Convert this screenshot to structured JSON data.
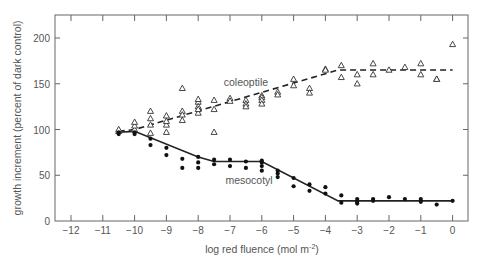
{
  "chart_data": {
    "type": "scatter",
    "title": "",
    "xlabel": "log red fluence (mol m",
    "xlabel_sup": "-2",
    "xlabel_end": ")",
    "ylabel": "growth increment (percent of dark control)",
    "xlim": [
      -12.5,
      0.5
    ],
    "ylim": [
      0,
      225
    ],
    "xticks": [
      -12,
      -11,
      -10,
      -9,
      -8,
      -7,
      -6,
      -5,
      -4,
      -3,
      -2,
      -1,
      0
    ],
    "xtick_labels": [
      "−12",
      "−11",
      "−10",
      "−9",
      "−8",
      "−7",
      "−6",
      "−5",
      "−4",
      "−3",
      "−2",
      "−1",
      "0"
    ],
    "yticks": [
      0,
      50,
      100,
      150,
      200
    ],
    "ytick_labels": [
      "0",
      "50",
      "100",
      "150",
      "200"
    ],
    "grid": false,
    "series": [
      {
        "name": "coleoptile",
        "marker": "open-triangle",
        "line": "dashed",
        "fit": [
          [
            -10.5,
            98
          ],
          [
            -10,
            100
          ],
          [
            -3.6,
            165
          ],
          [
            0,
            165
          ]
        ],
        "points": [
          [
            -10.5,
            98
          ],
          [
            -10.5,
            100
          ],
          [
            -10,
            100
          ],
          [
            -10,
            104
          ],
          [
            -10,
            108
          ],
          [
            -9.5,
            96
          ],
          [
            -9.5,
            105
          ],
          [
            -9.5,
            112
          ],
          [
            -9.5,
            120
          ],
          [
            -9,
            97
          ],
          [
            -9,
            105
          ],
          [
            -9,
            109
          ],
          [
            -9,
            115
          ],
          [
            -8.5,
            110
          ],
          [
            -8.5,
            145
          ],
          [
            -8.5,
            120
          ],
          [
            -8.5,
            116
          ],
          [
            -8,
            130
          ],
          [
            -8,
            125
          ],
          [
            -8,
            118
          ],
          [
            -8,
            122
          ],
          [
            -8,
            133
          ],
          [
            -7.5,
            132
          ],
          [
            -7.5,
            122
          ],
          [
            -7.5,
            97
          ],
          [
            -7,
            134
          ],
          [
            -7,
            131
          ],
          [
            -6.5,
            132
          ],
          [
            -6.5,
            128
          ],
          [
            -6.5,
            125
          ],
          [
            -6,
            137
          ],
          [
            -6,
            135
          ],
          [
            -6,
            132
          ],
          [
            -6,
            128
          ],
          [
            -5.5,
            141
          ],
          [
            -5.5,
            138
          ],
          [
            -5,
            155
          ],
          [
            -5,
            148
          ],
          [
            -4.5,
            145
          ],
          [
            -4.5,
            140
          ],
          [
            -4,
            166
          ],
          [
            -4,
            165
          ],
          [
            -3.5,
            170
          ],
          [
            -3.5,
            157
          ],
          [
            -3,
            160
          ],
          [
            -3,
            150
          ],
          [
            -2.5,
            172
          ],
          [
            -2.5,
            160
          ],
          [
            -2,
            165
          ],
          [
            -1.5,
            168
          ],
          [
            -1,
            172
          ],
          [
            -1,
            160
          ],
          [
            -0.5,
            155
          ],
          [
            -0.5,
            155
          ],
          [
            0,
            193
          ]
        ]
      },
      {
        "name": "mesocotyl",
        "marker": "filled-circle",
        "line": "solid",
        "fit": [
          [
            -10.5,
            97
          ],
          [
            -10,
            98
          ],
          [
            -8,
            70
          ],
          [
            -7.5,
            65
          ],
          [
            -6,
            65
          ],
          [
            -3.6,
            22
          ],
          [
            0,
            22
          ]
        ],
        "points": [
          [
            -10.5,
            95
          ],
          [
            -10.5,
            97
          ],
          [
            -10,
            95
          ],
          [
            -10,
            97
          ],
          [
            -9.5,
            83
          ],
          [
            -9.5,
            90
          ],
          [
            -9,
            80
          ],
          [
            -9,
            72
          ],
          [
            -8.5,
            68
          ],
          [
            -8.5,
            58
          ],
          [
            -8,
            70
          ],
          [
            -8,
            64
          ],
          [
            -8,
            58
          ],
          [
            -7.5,
            67
          ],
          [
            -7.5,
            62
          ],
          [
            -7,
            67
          ],
          [
            -7,
            60
          ],
          [
            -6.5,
            65
          ],
          [
            -6.5,
            58
          ],
          [
            -6,
            66
          ],
          [
            -6,
            64
          ],
          [
            -6,
            60
          ],
          [
            -6,
            55
          ],
          [
            -5.5,
            55
          ],
          [
            -5.5,
            52
          ],
          [
            -5.5,
            48
          ],
          [
            -5,
            47
          ],
          [
            -5,
            38
          ],
          [
            -4.5,
            40
          ],
          [
            -4.5,
            33
          ],
          [
            -4,
            37
          ],
          [
            -4,
            30
          ],
          [
            -3.5,
            28
          ],
          [
            -3.5,
            20
          ],
          [
            -3,
            24
          ],
          [
            -3,
            21
          ],
          [
            -3,
            19
          ],
          [
            -2.5,
            24
          ],
          [
            -2.5,
            22
          ],
          [
            -2,
            26
          ],
          [
            -1.5,
            24
          ],
          [
            -1,
            24
          ],
          [
            -1,
            21
          ],
          [
            -0.5,
            18
          ],
          [
            0,
            22
          ]
        ]
      }
    ],
    "annotations": [
      {
        "text": "coleoptile",
        "x": -6.5,
        "y": 147
      },
      {
        "text": "mesocotyl",
        "x": -6.4,
        "y": 40
      }
    ]
  }
}
